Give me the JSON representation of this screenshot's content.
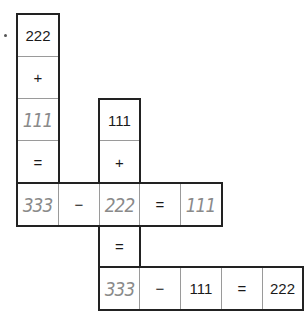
{
  "puzzle": {
    "column_a": [
      "222",
      "+",
      "111",
      "=",
      "333"
    ],
    "row_middle": [
      "333",
      "−",
      "222",
      "=",
      "111"
    ],
    "column_c": [
      "111",
      "+",
      "222",
      "=",
      "333"
    ],
    "row_bottom": [
      "333",
      "−",
      "111",
      "=",
      "222"
    ]
  },
  "colors": {
    "printed_text": "#1a1a1a",
    "handwritten_text": "#8a8a8a",
    "border": "#222222",
    "inner_grid": "#9a9a9a"
  }
}
